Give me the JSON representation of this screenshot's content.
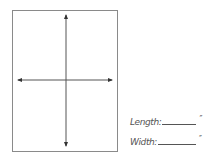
{
  "diagram": {
    "box": {
      "left": 12,
      "top": 10,
      "width": 106,
      "height": 142,
      "stroke": "#8a8a8a"
    },
    "axes": {
      "color": "#444444",
      "horizontal": {
        "x1": 18,
        "x2": 112,
        "y": 80
      },
      "vertical": {
        "x": 66,
        "y1": 15,
        "y2": 146
      }
    }
  },
  "fields": {
    "length": {
      "label": "Length:",
      "unit": "″",
      "blank_width": 34
    },
    "width": {
      "label": "Width:",
      "unit": "″",
      "blank_width": 38
    }
  }
}
